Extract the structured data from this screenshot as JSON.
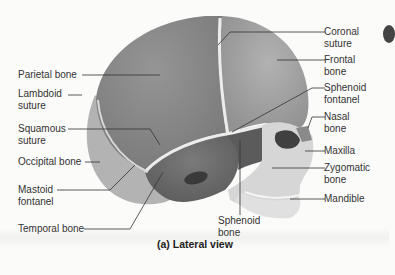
{
  "figure": {
    "caption": "(a) Lateral view",
    "colors": {
      "parietal": "#8c8c8c",
      "frontal": "#a2a2a2",
      "occipital": "#b4b4b4",
      "temporal": "#6d6d6d",
      "sphenoid": "#5e5e5e",
      "facial": "#d8d8d8",
      "suture": "#e8e8e6",
      "background": "#fbfbfa",
      "leader": "#333333"
    }
  },
  "labels": {
    "left": [
      {
        "id": "parietal-bone",
        "line1": "Parietal bone",
        "line2": ""
      },
      {
        "id": "lambdoid-suture",
        "line1": "Lambdoid",
        "line2": "suture"
      },
      {
        "id": "squamous-suture",
        "line1": "Squamous",
        "line2": "suture"
      },
      {
        "id": "occipital-bone",
        "line1": "Occipital bone",
        "line2": ""
      },
      {
        "id": "mastoid-fontanel",
        "line1": "Mastoid",
        "line2": "fontanel"
      },
      {
        "id": "temporal-bone",
        "line1": "Temporal bone",
        "line2": ""
      }
    ],
    "right": [
      {
        "id": "coronal-suture",
        "line1": "Coronal",
        "line2": "suture"
      },
      {
        "id": "frontal-bone",
        "line1": "Frontal",
        "line2": "bone"
      },
      {
        "id": "sphenoid-fontanel",
        "line1": "Sphenoid",
        "line2": "fontanel"
      },
      {
        "id": "nasal-bone",
        "line1": "Nasal",
        "line2": "bone"
      },
      {
        "id": "maxilla",
        "line1": "Maxilla",
        "line2": ""
      },
      {
        "id": "zygomatic-bone",
        "line1": "Zygomatic",
        "line2": "bone"
      },
      {
        "id": "mandible",
        "line1": "Mandible",
        "line2": ""
      }
    ],
    "bottom": [
      {
        "id": "sphenoid-bone",
        "line1": "Sphenoid",
        "line2": "bone"
      }
    ]
  }
}
